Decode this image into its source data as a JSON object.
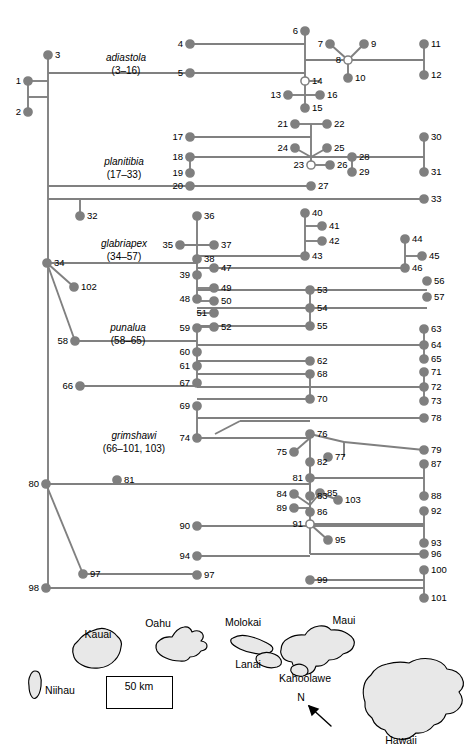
{
  "figure": {
    "type": "phylogenetic-tree-with-map"
  },
  "clades": [
    {
      "name": "adiastola",
      "range": "(3–16)",
      "x": 126,
      "y": 52
    },
    {
      "name": "planitibia",
      "range": "(17–33)",
      "x": 124,
      "y": 156
    },
    {
      "name": "glabriapex",
      "range": "(34–57)",
      "x": 124,
      "y": 238
    },
    {
      "name": "punalua",
      "range": "(58–65)",
      "x": 128,
      "y": 322
    },
    {
      "name": "grimshawi",
      "range": "(66–101, 103)",
      "x": 134,
      "y": 430
    }
  ],
  "terminals": [
    {
      "id": "1",
      "x": 28,
      "y": 81,
      "side": "r",
      "filled": true
    },
    {
      "id": "2",
      "x": 28,
      "y": 112,
      "side": "r",
      "filled": true
    },
    {
      "id": "3",
      "x": 48,
      "y": 55,
      "side": "l",
      "filled": true
    },
    {
      "id": "4",
      "x": 190,
      "y": 44,
      "side": "r",
      "filled": true
    },
    {
      "id": "5",
      "x": 190,
      "y": 73,
      "side": "r",
      "filled": true
    },
    {
      "id": "6",
      "x": 305,
      "y": 31,
      "side": "r",
      "filled": true
    },
    {
      "id": "7",
      "x": 330,
      "y": 44,
      "side": "r",
      "filled": true
    },
    {
      "id": "8",
      "x": 348,
      "y": 60,
      "side": "r",
      "filled": false
    },
    {
      "id": "9",
      "x": 364,
      "y": 44,
      "side": "l",
      "filled": true
    },
    {
      "id": "10",
      "x": 348,
      "y": 78,
      "side": "l",
      "filled": true
    },
    {
      "id": "11",
      "x": 424,
      "y": 44,
      "side": "l",
      "filled": true
    },
    {
      "id": "12",
      "x": 424,
      "y": 75,
      "side": "l",
      "filled": true
    },
    {
      "id": "13",
      "x": 288,
      "y": 95,
      "side": "r",
      "filled": true
    },
    {
      "id": "14",
      "x": 305,
      "y": 81,
      "side": "l",
      "filled": false
    },
    {
      "id": "15",
      "x": 305,
      "y": 108,
      "side": "l",
      "filled": true
    },
    {
      "id": "16",
      "x": 320,
      "y": 95,
      "side": "l",
      "filled": true
    },
    {
      "id": "17",
      "x": 190,
      "y": 137,
      "side": "r",
      "filled": true
    },
    {
      "id": "18",
      "x": 190,
      "y": 157,
      "side": "r",
      "filled": true
    },
    {
      "id": "19",
      "x": 190,
      "y": 173,
      "side": "r",
      "filled": true
    },
    {
      "id": "20",
      "x": 190,
      "y": 186,
      "side": "r",
      "filled": true
    },
    {
      "id": "21",
      "x": 295,
      "y": 124,
      "side": "r",
      "filled": true
    },
    {
      "id": "22",
      "x": 327,
      "y": 124,
      "side": "l",
      "filled": true
    },
    {
      "id": "23",
      "x": 311,
      "y": 165,
      "side": "r",
      "filled": false
    },
    {
      "id": "24",
      "x": 295,
      "y": 148,
      "side": "r",
      "filled": true
    },
    {
      "id": "25",
      "x": 327,
      "y": 148,
      "side": "l",
      "filled": true
    },
    {
      "id": "26",
      "x": 330,
      "y": 165,
      "side": "l",
      "filled": true
    },
    {
      "id": "27",
      "x": 311,
      "y": 186,
      "side": "l",
      "filled": true
    },
    {
      "id": "28",
      "x": 352,
      "y": 157,
      "side": "l",
      "filled": true
    },
    {
      "id": "29",
      "x": 352,
      "y": 172,
      "side": "l",
      "filled": true
    },
    {
      "id": "30",
      "x": 424,
      "y": 137,
      "side": "l",
      "filled": true
    },
    {
      "id": "31",
      "x": 424,
      "y": 172,
      "side": "l",
      "filled": true
    },
    {
      "id": "32",
      "x": 80,
      "y": 216,
      "side": "l",
      "filled": true
    },
    {
      "id": "33",
      "x": 424,
      "y": 199,
      "side": "l",
      "filled": true
    },
    {
      "id": "34",
      "x": 47,
      "y": 263,
      "side": "l",
      "filled": true
    },
    {
      "id": "35",
      "x": 180,
      "y": 245,
      "side": "r",
      "filled": true
    },
    {
      "id": "36",
      "x": 197,
      "y": 216,
      "side": "l",
      "filled": true
    },
    {
      "id": "37",
      "x": 214,
      "y": 245,
      "side": "l",
      "filled": true
    },
    {
      "id": "38",
      "x": 197,
      "y": 259,
      "side": "l",
      "filled": true
    },
    {
      "id": "39",
      "x": 197,
      "y": 275,
      "side": "r",
      "filled": true
    },
    {
      "id": "40",
      "x": 305,
      "y": 213,
      "side": "l",
      "filled": true
    },
    {
      "id": "41",
      "x": 322,
      "y": 226,
      "side": "l",
      "filled": true
    },
    {
      "id": "42",
      "x": 322,
      "y": 241,
      "side": "l",
      "filled": true
    },
    {
      "id": "43",
      "x": 305,
      "y": 256,
      "side": "l",
      "filled": true
    },
    {
      "id": "44",
      "x": 405,
      "y": 239,
      "side": "l",
      "filled": true
    },
    {
      "id": "45",
      "x": 422,
      "y": 256,
      "side": "l",
      "filled": true
    },
    {
      "id": "46",
      "x": 405,
      "y": 268,
      "side": "l",
      "filled": true
    },
    {
      "id": "47",
      "x": 214,
      "y": 268,
      "side": "l",
      "filled": true
    },
    {
      "id": "48",
      "x": 197,
      "y": 299,
      "side": "r",
      "filled": true
    },
    {
      "id": "49",
      "x": 214,
      "y": 288,
      "side": "l",
      "filled": true
    },
    {
      "id": "50",
      "x": 214,
      "y": 301,
      "side": "l",
      "filled": true
    },
    {
      "id": "51",
      "x": 214,
      "y": 313,
      "side": "r",
      "filled": true
    },
    {
      "id": "52",
      "x": 214,
      "y": 327,
      "side": "l",
      "filled": true
    },
    {
      "id": "53",
      "x": 310,
      "y": 290,
      "side": "l",
      "filled": true
    },
    {
      "id": "54",
      "x": 310,
      "y": 308,
      "side": "l",
      "filled": true
    },
    {
      "id": "55",
      "x": 310,
      "y": 326,
      "side": "l",
      "filled": true
    },
    {
      "id": "56",
      "x": 427,
      "y": 281,
      "side": "l",
      "filled": true
    },
    {
      "id": "57",
      "x": 427,
      "y": 297,
      "side": "l",
      "filled": true
    },
    {
      "id": "58",
      "x": 75,
      "y": 341,
      "side": "r",
      "filled": true
    },
    {
      "id": "59",
      "x": 197,
      "y": 328,
      "side": "r",
      "filled": true
    },
    {
      "id": "60",
      "x": 197,
      "y": 352,
      "side": "r",
      "filled": true
    },
    {
      "id": "61",
      "x": 197,
      "y": 366,
      "side": "r",
      "filled": true
    },
    {
      "id": "62",
      "x": 310,
      "y": 361,
      "side": "l",
      "filled": true
    },
    {
      "id": "63",
      "x": 424,
      "y": 329,
      "side": "l",
      "filled": true
    },
    {
      "id": "64",
      "x": 424,
      "y": 345,
      "side": "l",
      "filled": true
    },
    {
      "id": "65",
      "x": 424,
      "y": 359,
      "side": "l",
      "filled": true
    },
    {
      "id": "66",
      "x": 80,
      "y": 386,
      "side": "r",
      "filled": true
    },
    {
      "id": "67",
      "x": 197,
      "y": 383,
      "side": "r",
      "filled": true
    },
    {
      "id": "68",
      "x": 310,
      "y": 374,
      "side": "l",
      "filled": true
    },
    {
      "id": "69",
      "x": 197,
      "y": 406,
      "side": "r",
      "filled": true
    },
    {
      "id": "70",
      "x": 310,
      "y": 399,
      "side": "l",
      "filled": true
    },
    {
      "id": "71",
      "x": 424,
      "y": 372,
      "side": "l",
      "filled": true
    },
    {
      "id": "72",
      "x": 424,
      "y": 387,
      "side": "l",
      "filled": true
    },
    {
      "id": "73",
      "x": 424,
      "y": 401,
      "side": "l",
      "filled": true
    },
    {
      "id": "74",
      "x": 197,
      "y": 438,
      "side": "r",
      "filled": true
    },
    {
      "id": "75",
      "x": 294,
      "y": 452,
      "side": "r",
      "filled": true
    },
    {
      "id": "76",
      "x": 310,
      "y": 434,
      "side": "l",
      "filled": true
    },
    {
      "id": "77",
      "x": 328,
      "y": 457,
      "side": "l",
      "filled": true
    },
    {
      "id": "78",
      "x": 424,
      "y": 418,
      "side": "l",
      "filled": true
    },
    {
      "id": "79",
      "x": 424,
      "y": 450,
      "side": "l",
      "filled": true
    },
    {
      "id": "80",
      "x": 46,
      "y": 484,
      "side": "r",
      "filled": true
    },
    {
      "id": "81",
      "x": 117,
      "y": 480,
      "side": "l",
      "filled": true
    },
    {
      "id": "81b",
      "label": "81",
      "x": 310,
      "y": 478,
      "side": "r",
      "filled": true
    },
    {
      "id": "82",
      "x": 310,
      "y": 462,
      "side": "l",
      "filled": true
    },
    {
      "id": "83",
      "x": 310,
      "y": 496,
      "side": "l",
      "filled": true
    },
    {
      "id": "84",
      "x": 294,
      "y": 494,
      "side": "r",
      "filled": true
    },
    {
      "id": "85",
      "x": 320,
      "y": 493,
      "side": "l",
      "filled": true
    },
    {
      "id": "86",
      "x": 310,
      "y": 512,
      "side": "l",
      "filled": true
    },
    {
      "id": "87",
      "x": 424,
      "y": 464,
      "side": "l",
      "filled": true
    },
    {
      "id": "88",
      "x": 424,
      "y": 496,
      "side": "l",
      "filled": true
    },
    {
      "id": "89",
      "x": 294,
      "y": 508,
      "side": "r",
      "filled": true
    },
    {
      "id": "90",
      "x": 197,
      "y": 526,
      "side": "r",
      "filled": true
    },
    {
      "id": "91",
      "x": 310,
      "y": 524,
      "side": "r",
      "filled": false
    },
    {
      "id": "92",
      "x": 424,
      "y": 511,
      "side": "l",
      "filled": true
    },
    {
      "id": "93",
      "x": 424,
      "y": 543,
      "side": "l",
      "filled": true
    },
    {
      "id": "94",
      "x": 197,
      "y": 556,
      "side": "r",
      "filled": true
    },
    {
      "id": "95",
      "x": 328,
      "y": 540,
      "side": "l",
      "filled": true
    },
    {
      "id": "96",
      "x": 424,
      "y": 554,
      "side": "l",
      "filled": true
    },
    {
      "id": "97",
      "x": 83,
      "y": 574,
      "side": "l",
      "filled": true
    },
    {
      "id": "97b",
      "label": "97",
      "x": 197,
      "y": 575,
      "side": "l",
      "filled": true
    },
    {
      "id": "98",
      "x": 46,
      "y": 588,
      "side": "r",
      "filled": true
    },
    {
      "id": "99",
      "x": 310,
      "y": 580,
      "side": "l",
      "filled": true
    },
    {
      "id": "100",
      "x": 424,
      "y": 570,
      "side": "l",
      "filled": true
    },
    {
      "id": "101",
      "x": 424,
      "y": 598,
      "side": "l",
      "filled": true
    },
    {
      "id": "102",
      "x": 74,
      "y": 287,
      "side": "l",
      "filled": true
    },
    {
      "id": "103",
      "x": 338,
      "y": 500,
      "side": "l",
      "filled": true
    }
  ],
  "map": {
    "islands": [
      {
        "name": "Kauai",
        "label_x": 98,
        "label_y": 634
      },
      {
        "name": "Niihau",
        "label_x": 60,
        "label_y": 690
      },
      {
        "name": "Oahu",
        "label_x": 158,
        "label_y": 623
      },
      {
        "name": "Molokai",
        "label_x": 243,
        "label_y": 622
      },
      {
        "name": "Lanai",
        "label_x": 248,
        "label_y": 664
      },
      {
        "name": "Maui",
        "label_x": 344,
        "label_y": 620
      },
      {
        "name": "Kahoolawe",
        "label_x": 305,
        "label_y": 678
      },
      {
        "name": "Hawaii",
        "label_x": 401,
        "label_y": 740
      }
    ],
    "scalebar": {
      "text": "50 km",
      "x": 107,
      "y": 679,
      "box_x": 107,
      "box_y": 688
    },
    "compass": {
      "label": "N",
      "x": 301,
      "y": 697
    }
  },
  "style": {
    "node_fill": "#7f7f7f",
    "node_open_fill": "#ffffff",
    "node_stroke": "#7f7f7f",
    "branch_color": "#808080",
    "island_fill": "#e8e8e8",
    "island_stroke": "#000000"
  }
}
